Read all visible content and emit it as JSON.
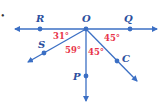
{
  "diagram": {
    "colors": {
      "line": "#3b6fc4",
      "angle": "#e8354a",
      "label": "#2b4f9e"
    },
    "bullet": "•",
    "points": {
      "O": "O",
      "R": "R",
      "Q": "Q",
      "S": "S",
      "P": "P",
      "C": "C"
    },
    "angles": {
      "ROS": "31°",
      "SOP": "59°",
      "POC": "45°",
      "COQ": "45°"
    }
  }
}
